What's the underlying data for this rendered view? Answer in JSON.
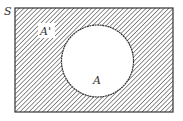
{
  "diagram": {
    "type": "venn",
    "universal_label": "S",
    "set_label": "A",
    "complement_label": "A'",
    "shaded_region": "complement of A",
    "colors": {
      "stroke": "#333333",
      "hatch": "#555555",
      "background": "#ffffff"
    }
  }
}
